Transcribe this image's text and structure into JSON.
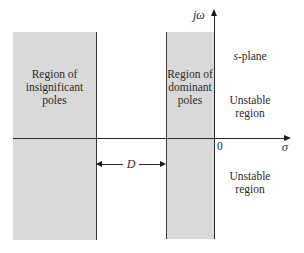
{
  "diagram": {
    "regions": [
      {
        "id": "insignificant",
        "label": "Region of insignificant poles",
        "lines": [
          "Region of",
          "insignificant",
          "poles"
        ],
        "fill": "#d9d9d9"
      },
      {
        "id": "dominant",
        "label": "Region of dominant poles",
        "lines": [
          "Region of",
          "dominant",
          "poles"
        ],
        "fill": "#d9d9d9"
      }
    ],
    "axes": {
      "vertical_label": "jω",
      "horizontal_label": "σ",
      "origin_label": "0"
    },
    "plane_label": {
      "italic_part": "s",
      "rest": "-plane"
    },
    "unstable_top": [
      "Unstable",
      "region"
    ],
    "unstable_bottom": [
      "Unstable",
      "region"
    ],
    "dimension": {
      "label": "D"
    },
    "colors": {
      "region_fill": "#d9d9d9",
      "line": "#2a2a2a",
      "background": "#ffffff"
    }
  }
}
